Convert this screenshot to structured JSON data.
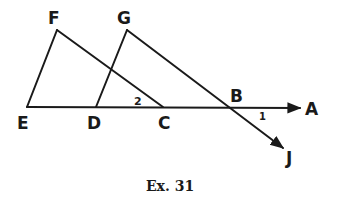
{
  "diagram": {
    "caption": "Ex. 31",
    "points": {
      "E": {
        "label": "E",
        "x": 27,
        "y": 107
      },
      "F": {
        "label": "F",
        "x": 57,
        "y": 30
      },
      "D": {
        "label": "D",
        "x": 96,
        "y": 107
      },
      "G": {
        "label": "G",
        "x": 127,
        "y": 30
      },
      "C": {
        "label": "C",
        "x": 163,
        "y": 107
      },
      "B": {
        "label": "B",
        "x": 234,
        "y": 108
      },
      "A": {
        "label": "A",
        "x": 310,
        "y": 108
      },
      "J": {
        "label": "J",
        "x": 290,
        "y": 152
      }
    },
    "angles": {
      "angle1": {
        "label": "1"
      },
      "angle2": {
        "label": "2"
      }
    },
    "segments": [
      "EF",
      "FC",
      "DG",
      "GJ",
      "EA"
    ],
    "rays": [
      "EA",
      "GJ"
    ],
    "colors": {
      "ink": "#1a1a1a",
      "background": "#ffffff"
    }
  }
}
